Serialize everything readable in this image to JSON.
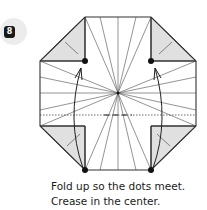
{
  "step": {
    "number": "8",
    "badge_color": "#ececec",
    "number_bg": "#1a1a1a"
  },
  "diagram": {
    "center": [
      118,
      93
    ],
    "dots": [
      [
        85,
        61
      ],
      [
        151,
        61
      ],
      [
        85,
        170
      ],
      [
        151,
        170
      ]
    ],
    "flap_fill": "#e0e0e0",
    "line_color": "#333333"
  },
  "caption": {
    "line1": "Fold up so the dots meet.",
    "line2": "Crease in the center."
  }
}
